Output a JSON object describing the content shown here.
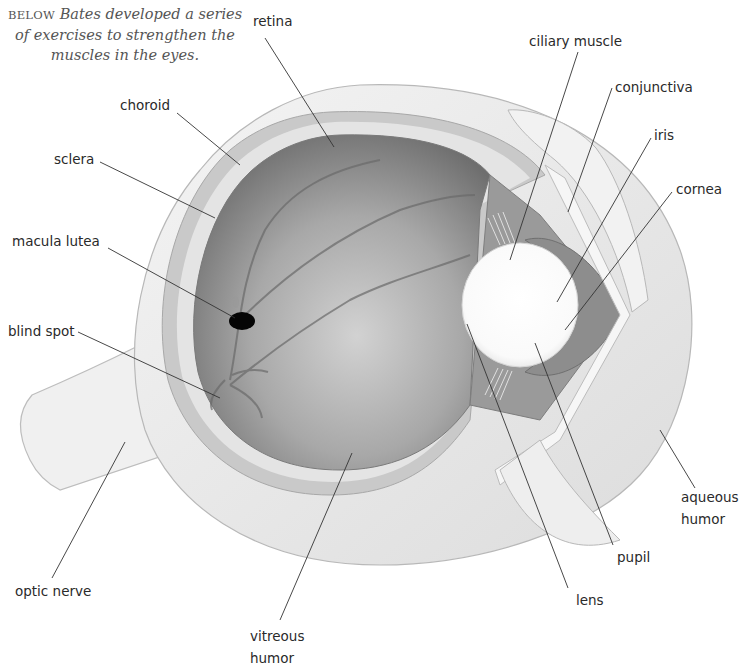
{
  "caption": {
    "lead": "BELOW",
    "line1": "Bates developed a series",
    "line2": "of exercises to strengthen the",
    "line3": "muscles in the eyes."
  },
  "labels": {
    "retina": "retina",
    "choroid": "choroid",
    "sclera": "sclera",
    "macula_lutea": "macula lutea",
    "blind_spot": "blind spot",
    "optic_nerve": "optic nerve",
    "vitreous_humor_1": "vitreous",
    "vitreous_humor_2": "humor",
    "ciliary_muscle": "ciliary muscle",
    "conjunctiva": "conjunctiva",
    "iris": "iris",
    "cornea": "cornea",
    "aqueous_humor_1": "aqueous",
    "aqueous_humor_2": "humor",
    "pupil": "pupil",
    "lens": "lens"
  },
  "colors": {
    "sclera": "#ececec",
    "choroid": "#c8c8c8",
    "retina_interior": "#8a8a8a",
    "leader_line": "#333333",
    "text": "#2a2a2a"
  }
}
